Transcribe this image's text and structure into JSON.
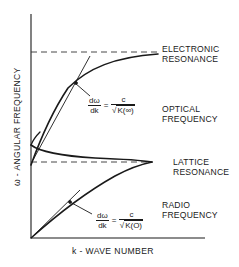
{
  "diagram": {
    "axes": {
      "y_label": "ω - ANGULAR FREQUENCY",
      "x_label": "k - WAVE NUMBER"
    },
    "region_labels": {
      "electronic_resonance": [
        "ELECTRONIC",
        "RESONANCE"
      ],
      "optical_frequency": [
        "OPTICAL",
        "FREQUENCY"
      ],
      "lattice_resonance": [
        "LATTICE",
        "RESONANCE"
      ],
      "radio_frequency": [
        "RADIO",
        "FREQUENCY"
      ]
    },
    "formulas": {
      "optical": {
        "numerator": "dω",
        "denominator": "dk",
        "equals": "=",
        "rhs_numerator": "c",
        "rhs_denominator": "K(∞)"
      },
      "radio": {
        "numerator": "dω",
        "denominator": "dk",
        "equals": "=",
        "rhs_numerator": "c",
        "rhs_denominator": "K(O)"
      }
    },
    "elements": {
      "asymptotes": [
        "electronic resonance (dashed)",
        "lattice resonance (dashed)"
      ],
      "curves": [
        "upper optical branch",
        "intermediate branch",
        "lower radio branch"
      ],
      "tangent_lines": [
        "optical slope tangent",
        "radio slope tangent"
      ]
    },
    "colors": {
      "ink": "#1a1a1a",
      "background": "#ffffff"
    }
  }
}
